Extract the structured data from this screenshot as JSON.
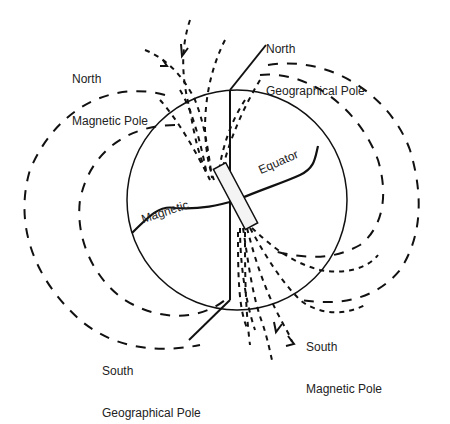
{
  "diagram": {
    "type": "earth-magnetic-field",
    "colors": {
      "line": "#111111",
      "background": "#ffffff",
      "text": "#222222"
    },
    "labels": {
      "north_magnetic_pole": [
        "North",
        "Magnetic Pole"
      ],
      "north_geographical_pole": [
        "North",
        "Geographical Pole"
      ],
      "south_geographical_pole": [
        "South",
        "Geographical Pole"
      ],
      "south_magnetic_pole": [
        "South",
        "Magnetic Pole"
      ],
      "magnetic_equator_left": "Magnetic",
      "magnetic_equator_right": "Equator"
    }
  }
}
